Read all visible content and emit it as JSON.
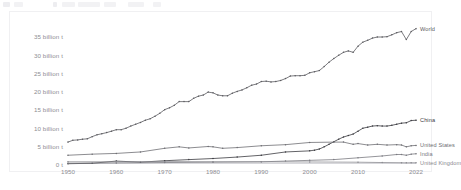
{
  "toolbar": {
    "blocks": [
      {
        "name": "toolbar-chip-1",
        "x": 3,
        "w": 7,
        "dark": true
      },
      {
        "name": "toolbar-chip-2",
        "x": 14,
        "w": 9,
        "dark": false
      },
      {
        "name": "toolbar-chip-3",
        "x": 53,
        "w": 4,
        "dark": true
      },
      {
        "name": "toolbar-chip-4",
        "x": 62,
        "w": 13,
        "dark": false
      },
      {
        "name": "toolbar-chip-5",
        "x": 78,
        "w": 22,
        "dark": false
      },
      {
        "name": "toolbar-chip-6",
        "x": 104,
        "w": 12,
        "dark": false
      },
      {
        "name": "toolbar-chip-7",
        "x": 128,
        "w": 16,
        "dark": false
      },
      {
        "name": "toolbar-chip-8",
        "x": 153,
        "w": 8,
        "dark": false
      }
    ]
  },
  "chart_data": {
    "type": "line",
    "title": "",
    "subtitle": "",
    "xlabel": "",
    "ylabel": "",
    "xlim": [
      1950,
      2022
    ],
    "ylim": [
      0,
      37
    ],
    "grid": false,
    "legend_position": "right-inline",
    "y_ticks": [
      0,
      5,
      10,
      15,
      20,
      25,
      30,
      35
    ],
    "y_tick_labels": [
      "0 t",
      "5 billion t",
      "10 billion t",
      "15 billion t",
      "20 billion t",
      "25 billion t",
      "30 billion t",
      "35 billion t"
    ],
    "x_ticks": [
      1950,
      1960,
      1970,
      1980,
      1990,
      2000,
      2010,
      2022
    ],
    "x_tick_labels": [
      "1950",
      "1960",
      "1970",
      "1980",
      "1990",
      "2000",
      "2010",
      "2022"
    ],
    "marker": "dot",
    "series": [
      {
        "name": "World",
        "label": "World",
        "color": "#5b5b60",
        "x": [
          1950,
          1951,
          1952,
          1953,
          1954,
          1955,
          1956,
          1957,
          1958,
          1959,
          1960,
          1961,
          1962,
          1963,
          1964,
          1965,
          1966,
          1967,
          1968,
          1969,
          1970,
          1971,
          1972,
          1973,
          1974,
          1975,
          1976,
          1977,
          1978,
          1979,
          1980,
          1981,
          1982,
          1983,
          1984,
          1985,
          1986,
          1987,
          1988,
          1989,
          1990,
          1991,
          1992,
          1993,
          1994,
          1995,
          1996,
          1997,
          1998,
          1999,
          2000,
          2001,
          2002,
          2003,
          2004,
          2005,
          2006,
          2007,
          2008,
          2009,
          2010,
          2011,
          2012,
          2013,
          2014,
          2015,
          2016,
          2017,
          2018,
          2019,
          2020,
          2021,
          2022
        ],
        "values": [
          6.0,
          6.5,
          6.6,
          6.8,
          6.9,
          7.5,
          8.0,
          8.3,
          8.6,
          9.0,
          9.4,
          9.4,
          9.8,
          10.4,
          10.9,
          11.4,
          12.0,
          12.4,
          13.1,
          13.9,
          14.9,
          15.4,
          16.1,
          17.1,
          17.1,
          17.1,
          18.0,
          18.6,
          18.9,
          19.7,
          19.5,
          18.9,
          18.7,
          18.7,
          19.4,
          19.9,
          20.3,
          20.9,
          21.6,
          21.9,
          22.6,
          22.7,
          22.5,
          22.6,
          22.9,
          23.4,
          24.1,
          24.2,
          24.2,
          24.3,
          25.0,
          25.3,
          25.6,
          26.7,
          27.9,
          28.9,
          29.8,
          30.6,
          31.0,
          30.6,
          32.3,
          33.4,
          33.9,
          34.5,
          34.8,
          34.8,
          34.9,
          35.4,
          36.0,
          36.3,
          34.1,
          36.3,
          37.1
        ]
      },
      {
        "name": "China",
        "label": "China",
        "color": "#3b3b40",
        "x": [
          1950,
          1955,
          1960,
          1965,
          1970,
          1975,
          1980,
          1985,
          1990,
          1995,
          2000,
          2001,
          2002,
          2003,
          2004,
          2005,
          2006,
          2007,
          2008,
          2009,
          2010,
          2011,
          2012,
          2013,
          2014,
          2015,
          2016,
          2017,
          2018,
          2019,
          2020,
          2021,
          2022
        ],
        "values": [
          0.08,
          0.2,
          0.8,
          0.5,
          0.9,
          1.2,
          1.5,
          1.9,
          2.4,
          3.3,
          3.6,
          3.8,
          4.1,
          4.7,
          5.4,
          6.1,
          6.8,
          7.4,
          7.8,
          8.2,
          9.0,
          9.8,
          10.1,
          10.4,
          10.5,
          10.4,
          10.4,
          10.6,
          10.9,
          11.2,
          11.3,
          11.9,
          12.0
        ]
      },
      {
        "name": "United States",
        "label": "United States",
        "color": "#6e6e73",
        "x": [
          1950,
          1955,
          1960,
          1965,
          1970,
          1973,
          1975,
          1979,
          1980,
          1982,
          1985,
          1990,
          1995,
          2000,
          2005,
          2007,
          2009,
          2010,
          2012,
          2014,
          2016,
          2018,
          2019,
          2020,
          2021,
          2022
        ],
        "values": [
          2.4,
          2.7,
          2.9,
          3.3,
          4.3,
          4.7,
          4.4,
          4.8,
          4.7,
          4.3,
          4.5,
          5.0,
          5.3,
          5.9,
          6.0,
          6.0,
          5.4,
          5.6,
          5.2,
          5.4,
          5.2,
          5.3,
          5.2,
          4.7,
          5.0,
          5.1
        ]
      },
      {
        "name": "India",
        "label": "India",
        "color": "#7a7a80",
        "x": [
          1950,
          1960,
          1970,
          1980,
          1990,
          1995,
          2000,
          2005,
          2010,
          2015,
          2018,
          2019,
          2020,
          2021,
          2022
        ],
        "values": [
          0.2,
          0.3,
          0.4,
          0.5,
          0.6,
          0.8,
          1.0,
          1.2,
          1.7,
          2.2,
          2.6,
          2.6,
          2.4,
          2.7,
          2.8
        ]
      },
      {
        "name": "United Kingdom",
        "label": "United Kingdom",
        "color": "#8a8a90",
        "x": [
          1950,
          1960,
          1970,
          1980,
          1990,
          2000,
          2010,
          2015,
          2019,
          2020,
          2021,
          2022
        ],
        "values": [
          0.6,
          0.6,
          0.65,
          0.6,
          0.59,
          0.55,
          0.49,
          0.4,
          0.35,
          0.32,
          0.34,
          0.33
        ]
      }
    ]
  }
}
